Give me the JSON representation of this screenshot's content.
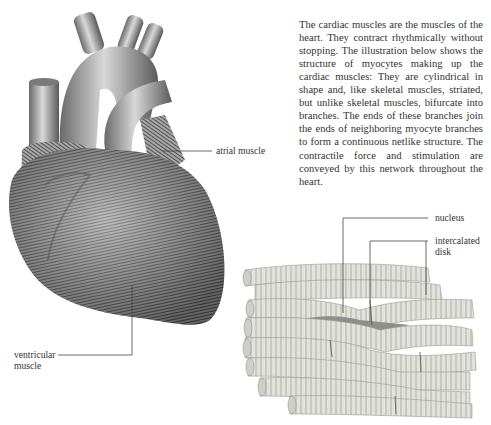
{
  "description": "The cardiac muscles are the muscles of the heart. They contract rhythmically without stopping. The illustration below shows the structure of myocytes making up the cardiac muscles: They are cylindrical in shape and, like skeletal muscles, striated, but unlike skeletal muscles, bifurcate into branches. The ends of these branches join the ends of neighboring myocyte branches to form a continuous netlike structure. The contractile force and stimulation are conveyed by this network throughout the heart.",
  "figures": {
    "heart": {
      "labels": {
        "atrial": "atrial muscle",
        "ventricular_line1": "ventricular",
        "ventricular_line2": "muscle"
      }
    },
    "myocytes": {
      "labels": {
        "nucleus": "nucleus",
        "intercalated_line1": "intercalated",
        "intercalated_line2": "disk"
      }
    }
  },
  "colors": {
    "background": "#ffffff",
    "text": "#333333",
    "heart_shade": "#8a8a8a",
    "myocyte_fill": "#dcdcd6"
  }
}
